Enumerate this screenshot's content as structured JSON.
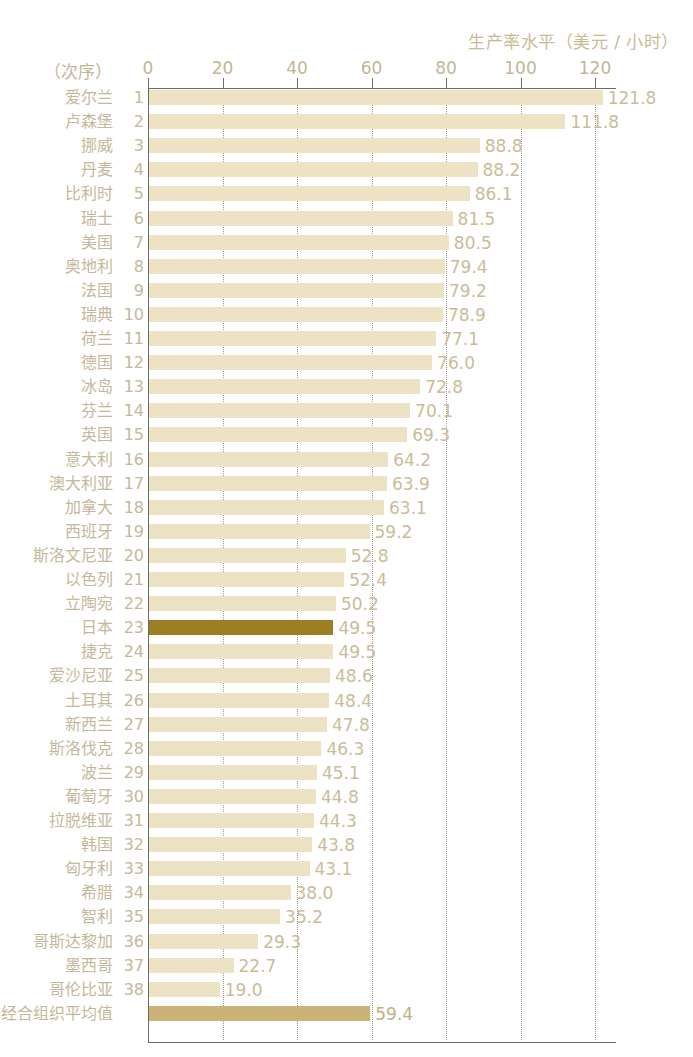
{
  "chart_data": {
    "type": "bar",
    "orientation": "horizontal",
    "title": "生产率水平（美元 / 小时）",
    "xlabel": "",
    "ylabel": "",
    "rank_header": "（次序）",
    "xlim": [
      0,
      125
    ],
    "xticks": [
      0,
      20,
      40,
      60,
      80,
      100,
      120
    ],
    "xtick_labels": [
      "0",
      "20",
      "40",
      "60",
      "80",
      "100",
      "120"
    ],
    "grid": "vertical-dotted",
    "legend": "none",
    "categories": [
      "爱尔兰",
      "卢森堡",
      "挪威",
      "丹麦",
      "比利时",
      "瑞士",
      "美国",
      "奥地利",
      "法国",
      "瑞典",
      "荷兰",
      "德国",
      "冰岛",
      "芬兰",
      "英国",
      "意大利",
      "澳大利亚",
      "加拿大",
      "西班牙",
      "斯洛文尼亚",
      "以色列",
      "立陶宛",
      "日本",
      "捷克",
      "爱沙尼亚",
      "土耳其",
      "新西兰",
      "斯洛伐克",
      "波兰",
      "葡萄牙",
      "拉脱维亚",
      "韩国",
      "匈牙利",
      "希腊",
      "智利",
      "哥斯达黎加",
      "墨西哥",
      "哥伦比亚",
      "经合组织平均值"
    ],
    "ranks": [
      "1",
      "2",
      "3",
      "4",
      "5",
      "6",
      "7",
      "8",
      "9",
      "10",
      "11",
      "12",
      "13",
      "14",
      "15",
      "16",
      "17",
      "18",
      "19",
      "20",
      "21",
      "22",
      "23",
      "24",
      "25",
      "26",
      "27",
      "28",
      "29",
      "30",
      "31",
      "32",
      "33",
      "34",
      "35",
      "36",
      "37",
      "38",
      ""
    ],
    "values": [
      121.8,
      111.8,
      88.8,
      88.2,
      86.1,
      81.5,
      80.5,
      79.4,
      79.2,
      78.9,
      77.1,
      76.0,
      72.8,
      70.1,
      69.3,
      64.2,
      63.9,
      63.1,
      59.2,
      52.8,
      52.4,
      50.2,
      49.5,
      49.5,
      48.6,
      48.4,
      47.8,
      46.3,
      45.1,
      44.8,
      44.3,
      43.8,
      43.1,
      38.0,
      35.2,
      29.3,
      22.7,
      19.0,
      59.4
    ],
    "value_labels": [
      "121.8",
      "111.8",
      "88.8",
      "88.2",
      "86.1",
      "81.5",
      "80.5",
      "79.4",
      "79.2",
      "78.9",
      "77.1",
      "76.0",
      "72.8",
      "70.1",
      "69.3",
      "64.2",
      "63.9",
      "63.1",
      "59.2",
      "52.8",
      "52.4",
      "50.2",
      "49.5",
      "49.5",
      "48.6",
      "48.4",
      "47.8",
      "46.3",
      "45.1",
      "44.8",
      "44.3",
      "43.8",
      "43.1",
      "38.0",
      "35.2",
      "29.3",
      "22.7",
      "19.0",
      "59.4"
    ],
    "highlight_index": 22,
    "average_index": 38,
    "colors": {
      "bar": "#ede2c4",
      "bar_highlight": "#9c7f23",
      "bar_average": "#cdb278",
      "text": "#c5b89a",
      "value_text": "#cabc99",
      "axis": "#6d6a63",
      "gridline": "#a09a88"
    }
  }
}
